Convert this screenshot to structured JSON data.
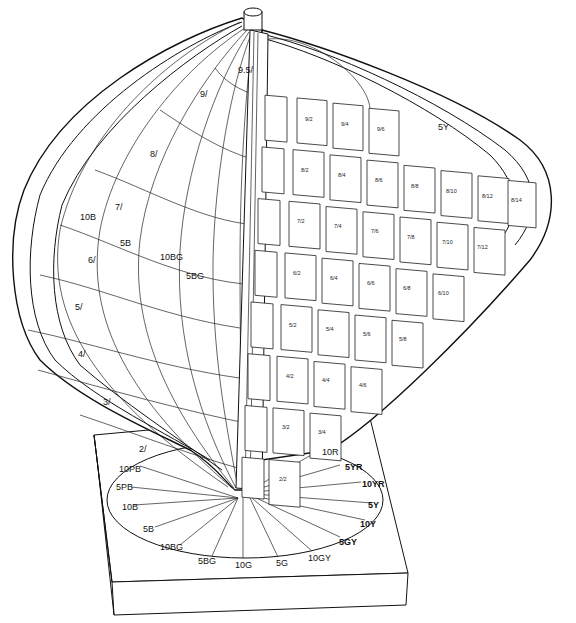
{
  "hue_page": {
    "label": "5Y",
    "chips": [
      [
        "9/2",
        "9/4",
        "9/6"
      ],
      [
        "8/2",
        "8/4",
        "8/6",
        "8/8",
        "8/10",
        "8/12",
        "8/14"
      ],
      [
        "7/2",
        "7/4",
        "7/6",
        "7/8",
        "7/10",
        "7/12"
      ],
      [
        "6/2",
        "6/4",
        "6/6",
        "6/8",
        "6/10"
      ],
      [
        "5/2",
        "5/4",
        "5/6",
        "5/8"
      ],
      [
        "4/2",
        "4/4",
        "4/6"
      ],
      [
        "3/2",
        "3/4"
      ],
      [
        "2/2"
      ]
    ]
  },
  "value_labels": [
    "9.5/",
    "9/",
    "8/",
    "7/",
    "6/",
    "5/",
    "4/",
    "3/",
    "2/"
  ],
  "hue_labels_solid": [
    "10B",
    "5B",
    "10BG",
    "5BG"
  ],
  "base_hue_circle": {
    "left": [
      "10PB",
      "5PB",
      "10B",
      "5B",
      "10BG",
      "5BG",
      "10G",
      "5G",
      "10GY"
    ],
    "right": [
      "10R",
      "5YR",
      "10YR",
      "5Y",
      "10Y",
      "5GY"
    ]
  }
}
